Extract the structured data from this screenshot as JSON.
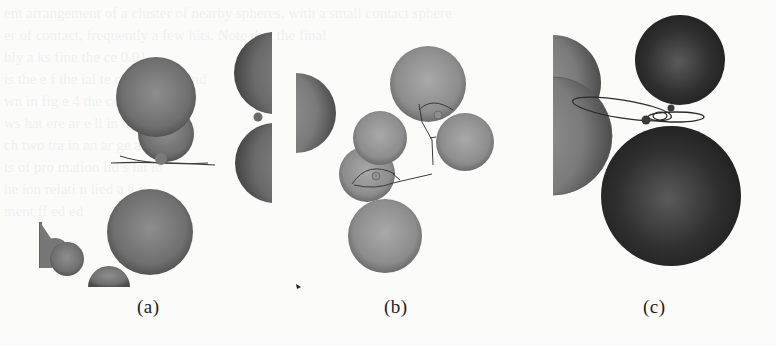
{
  "figure": {
    "panels": [
      {
        "id": "a",
        "caption": "(a)"
      },
      {
        "id": "b",
        "caption": "(b)"
      },
      {
        "id": "c",
        "caption": "(c)"
      }
    ],
    "colors": {
      "background": "#fbfbfa",
      "sphere_light": "#9a9a9a",
      "sphere_dark": "#2a2a2a",
      "line": "#3a3a3a"
    }
  },
  "bleed_through_text": [
    "ent arrangement of a cluster of nearby spheres, with a small contact sphere",
    "er   of contact, frequently a few    hits. Note that the final",
    "hly a    ks    fine  the  ce  0.01",
    "  is the  e  f   the  ial  te       of  a  cluster and",
    "  wn     in  fig  e 4   the  ce  al       of  stance",
    "           ws     hat  ere   ar  e  ll  in the",
    "   ch  two     tra     in    an  ar  ge  a",
    "  ts  of  pro  mation   lid  s     lat     lo",
    "  he  ion  relati    n  lied  a      g   y",
    "  ment  ff  ed    ed"
  ]
}
